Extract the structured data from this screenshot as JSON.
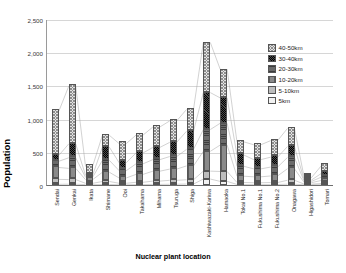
{
  "chart_data": {
    "type": "bar",
    "stacked": true,
    "title": "",
    "xlabel": "Nuclear plant location",
    "ylabel": "Population",
    "units_label": "Thousands",
    "ylim": [
      0,
      2500
    ],
    "yticks": [
      "0",
      "500",
      "1,000",
      "1,500",
      "2,000",
      "2,500"
    ],
    "ytick_values": [
      0,
      500,
      1000,
      1500,
      2000,
      2500
    ],
    "grid": true,
    "legend_position": "right",
    "categories": [
      "Sendai",
      "Genkai",
      "Ikata",
      "Shimane",
      "Ooi",
      "Takahama",
      "Mihama",
      "Tsuruga",
      "Shiga",
      "Kashiwazaki-Kariwa",
      "Hamaoka",
      "Tokai No.1",
      "Fukushima No.1",
      "Fukushima No.2",
      "Onagawa",
      "Higashidori",
      "Tomari"
    ],
    "series": [
      {
        "name": "5km",
        "values": [
          10,
          12,
          5,
          8,
          4,
          6,
          9,
          11,
          14,
          90,
          55,
          8,
          6,
          7,
          12,
          3,
          5
        ]
      },
      {
        "name": "5-10km",
        "values": [
          75,
          70,
          20,
          45,
          22,
          35,
          50,
          60,
          65,
          120,
          150,
          30,
          28,
          30,
          60,
          10,
          18
        ]
      },
      {
        "name": "10-20km",
        "values": [
          180,
          170,
          55,
          140,
          80,
          120,
          150,
          170,
          210,
          300,
          400,
          95,
          90,
          100,
          175,
          22,
          45
        ]
      },
      {
        "name": "20-30km",
        "values": [
          95,
          160,
          35,
          180,
          110,
          160,
          175,
          190,
          250,
          330,
          330,
          150,
          120,
          135,
          170,
          18,
          50
        ]
      },
      {
        "name": "30-40km",
        "values": [
          90,
          210,
          30,
          200,
          120,
          165,
          185,
          215,
          275,
          560,
          385,
          170,
          140,
          150,
          165,
          20,
          55
        ]
      },
      {
        "name": "40-50km",
        "values": [
          670,
          875,
          135,
          180,
          290,
          270,
          310,
          325,
          330,
          760,
          435,
          200,
          225,
          250,
          275,
          35,
          115
        ]
      }
    ],
    "series_colors": {
      "5km": "#f2f2f2",
      "5-10km": "#bdbdbd",
      "10-20km": "#8a8a8a",
      "20-30km": "#6a6a6a",
      "30-40km": "#2b2b2b",
      "40-50km": "#e2e2e2"
    },
    "totals": [
      1120,
      1497,
      280,
      753,
      626,
      756,
      879,
      971,
      1144,
      2160,
      1755,
      653,
      609,
      672,
      857,
      108,
      288
    ]
  },
  "legend": {
    "items": [
      {
        "label": "40-50km"
      },
      {
        "label": "30-40km"
      },
      {
        "label": "20-30km"
      },
      {
        "label": "10-20km"
      },
      {
        "label": "5-10km"
      },
      {
        "label": "5km"
      }
    ]
  }
}
